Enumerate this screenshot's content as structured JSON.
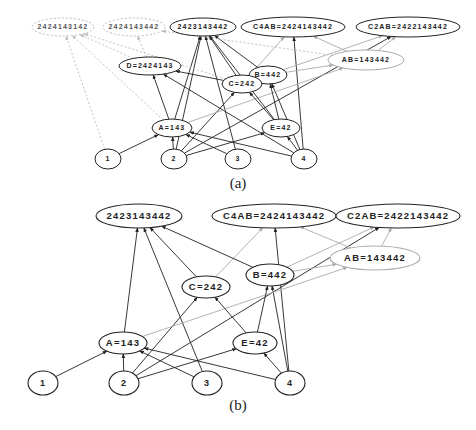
{
  "diagrams": [
    {
      "id": "a",
      "caption": "(a)",
      "nodes": [
        {
          "key": "s1",
          "label": "2424143142",
          "x": 63,
          "y": 27,
          "rx": 31,
          "ry": 9,
          "style": "dashed"
        },
        {
          "key": "s2",
          "label": "2424143442",
          "x": 134,
          "y": 27,
          "rx": 31,
          "ry": 9,
          "style": "dashed"
        },
        {
          "key": "s3",
          "label": "2423143442",
          "x": 203,
          "y": 27,
          "rx": 33,
          "ry": 9,
          "style": "solid"
        },
        {
          "key": "c4ab",
          "label": "C4AB=2424143442",
          "x": 293,
          "y": 27,
          "rx": 52,
          "ry": 10,
          "style": "solid"
        },
        {
          "key": "c2ab",
          "label": "C2AB=2422143442",
          "x": 408,
          "y": 27,
          "rx": 52,
          "ry": 10,
          "style": "solid"
        },
        {
          "key": "d",
          "label": "D=2424143",
          "x": 150,
          "y": 66,
          "rx": 31,
          "ry": 9,
          "style": "solid"
        },
        {
          "key": "b",
          "label": "B=442",
          "x": 268,
          "y": 75,
          "rx": 19,
          "ry": 9,
          "style": "solid"
        },
        {
          "key": "c",
          "label": "C=242",
          "x": 242,
          "y": 84,
          "rx": 20,
          "ry": 9,
          "style": "solid"
        },
        {
          "key": "ab",
          "label": "AB=143442",
          "x": 366,
          "y": 60,
          "rx": 38,
          "ry": 10,
          "style": "gray"
        },
        {
          "key": "a",
          "label": "A=143",
          "x": 172,
          "y": 128,
          "rx": 20,
          "ry": 9,
          "style": "solid"
        },
        {
          "key": "e",
          "label": "E=42",
          "x": 281,
          "y": 128,
          "rx": 19,
          "ry": 9,
          "style": "solid"
        },
        {
          "key": "n1",
          "label": "1",
          "x": 108,
          "y": 159,
          "rx": 13,
          "ry": 10,
          "style": "solid"
        },
        {
          "key": "n2",
          "label": "2",
          "x": 174,
          "y": 159,
          "rx": 13,
          "ry": 10,
          "style": "solid"
        },
        {
          "key": "n3",
          "label": "3",
          "x": 238,
          "y": 159,
          "rx": 13,
          "ry": 10,
          "style": "solid"
        },
        {
          "key": "n4",
          "label": "4",
          "x": 304,
          "y": 159,
          "rx": 13,
          "ry": 10,
          "style": "solid"
        }
      ],
      "edges": [
        {
          "from": "n1",
          "to": "a",
          "style": "solid"
        },
        {
          "from": "n1",
          "to": "s1",
          "style": "dashed"
        },
        {
          "from": "n2",
          "to": "a",
          "style": "solid"
        },
        {
          "from": "n2",
          "to": "c",
          "style": "solid"
        },
        {
          "from": "n2",
          "to": "e",
          "style": "solid"
        },
        {
          "from": "n2",
          "to": "c2ab",
          "style": "solid"
        },
        {
          "from": "n2",
          "to": "s3",
          "style": "solid"
        },
        {
          "from": "n3",
          "to": "a",
          "style": "solid"
        },
        {
          "from": "n3",
          "to": "s3",
          "style": "solid"
        },
        {
          "from": "n4",
          "to": "a",
          "style": "solid"
        },
        {
          "from": "n4",
          "to": "e",
          "style": "solid"
        },
        {
          "from": "n4",
          "to": "b",
          "style": "solid"
        },
        {
          "from": "n4",
          "to": "d",
          "style": "solid"
        },
        {
          "from": "n4",
          "to": "c4ab",
          "style": "solid"
        },
        {
          "from": "a",
          "to": "d",
          "style": "solid"
        },
        {
          "from": "a",
          "to": "s3",
          "style": "solid"
        },
        {
          "from": "a",
          "to": "ab",
          "style": "gray"
        },
        {
          "from": "a",
          "to": "s1",
          "style": "dashed"
        },
        {
          "from": "e",
          "to": "c",
          "style": "solid"
        },
        {
          "from": "e",
          "to": "b",
          "style": "solid"
        },
        {
          "from": "e",
          "to": "s3",
          "style": "solid"
        },
        {
          "from": "c",
          "to": "d",
          "style": "solid"
        },
        {
          "from": "c",
          "to": "s3",
          "style": "solid"
        },
        {
          "from": "c",
          "to": "c4ab",
          "style": "gray"
        },
        {
          "from": "b",
          "to": "s3",
          "style": "solid"
        },
        {
          "from": "b",
          "to": "c2ab",
          "style": "gray"
        },
        {
          "from": "b",
          "to": "ab",
          "style": "gray"
        },
        {
          "from": "ab",
          "to": "c4ab",
          "style": "gray"
        },
        {
          "from": "ab",
          "to": "c2ab",
          "style": "gray"
        },
        {
          "from": "ab",
          "to": "s2",
          "style": "dashed"
        },
        {
          "from": "d",
          "to": "s2",
          "style": "dashed"
        },
        {
          "from": "d",
          "to": "s1",
          "style": "dashed"
        },
        {
          "from": "c",
          "to": "s1",
          "style": "dashed"
        }
      ],
      "caption_pos": {
        "x": 238,
        "y": 188
      }
    },
    {
      "id": "b",
      "caption": "(b)",
      "nodes": [
        {
          "key": "s3",
          "label": "2423143442",
          "x": 139,
          "y": 216,
          "rx": 43,
          "ry": 12,
          "style": "solid"
        },
        {
          "key": "c4ab",
          "label": "C4AB=2424143442",
          "x": 274,
          "y": 216,
          "rx": 62,
          "ry": 12,
          "style": "solid"
        },
        {
          "key": "c2ab",
          "label": "C2AB=2422143442",
          "x": 398,
          "y": 216,
          "rx": 62,
          "ry": 12,
          "style": "solid"
        },
        {
          "key": "b",
          "label": "B=442",
          "x": 270,
          "y": 275,
          "rx": 24,
          "ry": 11,
          "style": "solid"
        },
        {
          "key": "c",
          "label": "C=242",
          "x": 206,
          "y": 287,
          "rx": 24,
          "ry": 11,
          "style": "solid"
        },
        {
          "key": "ab",
          "label": "AB=143442",
          "x": 375,
          "y": 258,
          "rx": 45,
          "ry": 12,
          "style": "gray"
        },
        {
          "key": "a",
          "label": "A=143",
          "x": 123,
          "y": 343,
          "rx": 24,
          "ry": 11,
          "style": "solid"
        },
        {
          "key": "e",
          "label": "E=42",
          "x": 255,
          "y": 343,
          "rx": 22,
          "ry": 11,
          "style": "solid"
        },
        {
          "key": "n1",
          "label": "1",
          "x": 43,
          "y": 383,
          "rx": 15,
          "ry": 12,
          "style": "solid"
        },
        {
          "key": "n2",
          "label": "2",
          "x": 124,
          "y": 383,
          "rx": 15,
          "ry": 12,
          "style": "solid"
        },
        {
          "key": "n3",
          "label": "3",
          "x": 207,
          "y": 383,
          "rx": 15,
          "ry": 12,
          "style": "solid"
        },
        {
          "key": "n4",
          "label": "4",
          "x": 290,
          "y": 383,
          "rx": 15,
          "ry": 12,
          "style": "solid"
        }
      ],
      "edges": [
        {
          "from": "n1",
          "to": "a",
          "style": "solid"
        },
        {
          "from": "n2",
          "to": "a",
          "style": "solid"
        },
        {
          "from": "n2",
          "to": "c",
          "style": "solid"
        },
        {
          "from": "n2",
          "to": "e",
          "style": "solid"
        },
        {
          "from": "n2",
          "to": "c2ab",
          "style": "solid"
        },
        {
          "from": "n3",
          "to": "a",
          "style": "solid"
        },
        {
          "from": "n3",
          "to": "s3",
          "style": "solid"
        },
        {
          "from": "n4",
          "to": "a",
          "style": "solid"
        },
        {
          "from": "n4",
          "to": "e",
          "style": "solid"
        },
        {
          "from": "n4",
          "to": "b",
          "style": "solid"
        },
        {
          "from": "n4",
          "to": "c4ab",
          "style": "solid"
        },
        {
          "from": "a",
          "to": "s3",
          "style": "solid"
        },
        {
          "from": "a",
          "to": "ab",
          "style": "gray"
        },
        {
          "from": "e",
          "to": "c",
          "style": "solid"
        },
        {
          "from": "e",
          "to": "b",
          "style": "solid"
        },
        {
          "from": "c",
          "to": "s3",
          "style": "solid"
        },
        {
          "from": "c",
          "to": "c4ab",
          "style": "gray"
        },
        {
          "from": "b",
          "to": "s3",
          "style": "solid"
        },
        {
          "from": "b",
          "to": "c2ab",
          "style": "gray"
        },
        {
          "from": "b",
          "to": "ab",
          "style": "gray"
        },
        {
          "from": "ab",
          "to": "c4ab",
          "style": "gray"
        },
        {
          "from": "ab",
          "to": "c2ab",
          "style": "gray"
        }
      ],
      "caption_pos": {
        "x": 238,
        "y": 410
      }
    }
  ]
}
